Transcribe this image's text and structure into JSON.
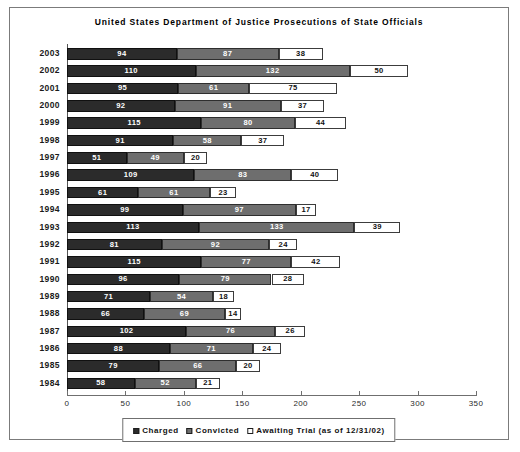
{
  "chart_data": {
    "type": "bar",
    "subtype": "stacked-horizontal",
    "title": "United States Department of Justice Prosecutions of State Officials",
    "xlabel": "",
    "ylabel": "",
    "xlim": [
      0,
      350
    ],
    "xticks": [
      0,
      50,
      100,
      150,
      200,
      250,
      300,
      350
    ],
    "grid": false,
    "legend_position": "bottom-center",
    "categories": [
      "2003",
      "2002",
      "2001",
      "2000",
      "1999",
      "1998",
      "1997",
      "1996",
      "1995",
      "1994",
      "1993",
      "1992",
      "1991",
      "1990",
      "1989",
      "1988",
      "1987",
      "1986",
      "1985",
      "1984"
    ],
    "series": [
      {
        "name": "Charged",
        "color": "#2b2b2b",
        "values": [
          94,
          110,
          95,
          92,
          115,
          91,
          51,
          109,
          61,
          99,
          113,
          81,
          115,
          96,
          71,
          66,
          102,
          88,
          79,
          58
        ]
      },
      {
        "name": "Convicted",
        "color": "#6e6e6e",
        "values": [
          87,
          132,
          61,
          91,
          80,
          58,
          49,
          83,
          61,
          97,
          133,
          92,
          77,
          79,
          54,
          69,
          76,
          71,
          66,
          52
        ]
      },
      {
        "name": "Awaiting Trial (as of 12/31/02)",
        "color": "#ffffff",
        "values": [
          38,
          50,
          75,
          37,
          44,
          37,
          20,
          40,
          23,
          17,
          39,
          24,
          42,
          28,
          18,
          14,
          26,
          24,
          20,
          21
        ]
      }
    ]
  },
  "legend": {
    "items": [
      {
        "label": "Charged",
        "swatch": "charged"
      },
      {
        "label": "Convicted",
        "swatch": "convicted"
      },
      {
        "label": "Awaiting Trial (as of 12/31/02)",
        "swatch": "awaiting"
      }
    ]
  },
  "colors": {
    "charged": "#2b2b2b",
    "convicted": "#6e6e6e",
    "awaiting": "#ffffff",
    "axis": "#6f6f6f",
    "frame_border": "#7b7b7b",
    "text": "#111111"
  }
}
